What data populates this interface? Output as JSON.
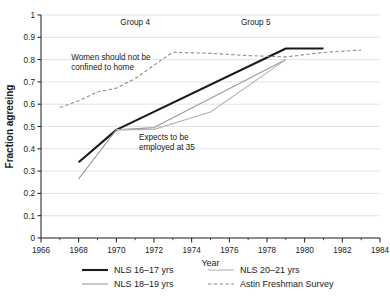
{
  "chart_data": {
    "type": "line",
    "title": "",
    "xlabel": "Year",
    "ylabel": "Fraction agreeing",
    "xlim": [
      1966,
      1984
    ],
    "ylim": [
      0,
      1
    ],
    "xticks": [
      1966,
      1968,
      1970,
      1972,
      1974,
      1976,
      1978,
      1980,
      1982,
      1984
    ],
    "xtick_labels": [
      "1966",
      "1968",
      "1970",
      "1972",
      "1974",
      "1976",
      "1978",
      "1980",
      "1982",
      "1984"
    ],
    "yticks": [
      0,
      0.1,
      0.2,
      0.3,
      0.4,
      0.5,
      0.6,
      0.7,
      0.8,
      0.9,
      1
    ],
    "ytick_labels": [
      "0",
      "0.1",
      "0.2",
      "0.3",
      "0.4",
      "0.5",
      "0.6",
      "0.7",
      "0.8",
      "0.9",
      "1"
    ],
    "grid": "horizontal",
    "minor_xticks": true,
    "legend_position": "bottom",
    "series": [
      {
        "name": "NLS 16–17 yrs",
        "style": "solid",
        "color": "#1a1a1a",
        "width": 2.1,
        "x": [
          1968,
          1970,
          1979,
          1981
        ],
        "y": [
          0.34,
          0.485,
          0.85,
          0.85
        ]
      },
      {
        "name": "NLS 18–19 yrs",
        "style": "solid",
        "color": "#9a9a9a",
        "width": 1.1,
        "x": [
          1968,
          1970,
          1972,
          1979
        ],
        "y": [
          0.265,
          0.485,
          0.495,
          0.8
        ]
      },
      {
        "name": "NLS 20–21 yrs",
        "style": "solid",
        "color": "#b5b5b5",
        "width": 1.1,
        "x": [
          1970,
          1972,
          1975,
          1979
        ],
        "y": [
          0.485,
          0.487,
          0.565,
          0.8
        ]
      },
      {
        "name": "Astin Freshman Survey",
        "style": "dashed",
        "color": "#8c8c8c",
        "width": 1.1,
        "x": [
          1967,
          1968,
          1969,
          1970,
          1971,
          1972,
          1973,
          1975,
          1977,
          1979,
          1981,
          1983
        ],
        "y": [
          0.585,
          0.615,
          0.655,
          0.672,
          0.715,
          0.775,
          0.833,
          0.828,
          0.818,
          0.812,
          0.832,
          0.843
        ]
      }
    ],
    "annotations": [
      {
        "name": "group-4",
        "lines": [
          "Group 4"
        ],
        "x": 1971.0,
        "y": 0.955
      },
      {
        "name": "group-5",
        "lines": [
          "Group 5"
        ],
        "x": 1977.4,
        "y": 0.955
      },
      {
        "name": "women-should-not-be-confined-to-home",
        "lines": [
          "Women should not be",
          "confined to home"
        ],
        "x": 1967.6,
        "y": 0.8
      },
      {
        "name": "expects-to-be-employed-at-35",
        "lines": [
          "Expects to be",
          "employed at 35"
        ],
        "x": 1971.2,
        "y": 0.44
      }
    ],
    "legend": [
      {
        "label": "NLS 16–17 yrs",
        "style": "solid",
        "color": "#1a1a1a",
        "width": 2.1
      },
      {
        "label": "NLS 20–21 yrs",
        "style": "solid",
        "color": "#b5b5b5",
        "width": 1.1
      },
      {
        "label": "NLS 18–19 yrs",
        "style": "solid",
        "color": "#9a9a9a",
        "width": 1.1
      },
      {
        "label": "Astin Freshman Survey",
        "style": "dashed",
        "color": "#8c8c8c",
        "width": 1.1
      }
    ]
  }
}
